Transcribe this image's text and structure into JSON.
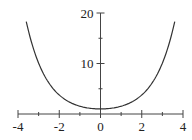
{
  "chart_data": {
    "type": "line",
    "title": "",
    "xlabel": "",
    "ylabel": "",
    "function": "y = cosh(x)",
    "xlim": [
      -4,
      4
    ],
    "ylim": [
      0,
      20
    ],
    "grid": false,
    "legend": null,
    "x_ticks_major": [
      -4,
      -2,
      0,
      2,
      4
    ],
    "x_ticks_minor": [
      -3,
      -1,
      1,
      3
    ],
    "x_tick_labels": [
      "-4",
      "-2",
      "0",
      "2",
      "4"
    ],
    "y_ticks_major": [
      10,
      20
    ],
    "y_ticks_minor": [
      5,
      15
    ],
    "y_tick_labels": [
      "10",
      "20"
    ],
    "series": [
      {
        "name": "curve",
        "color": "#333333",
        "x": [
          -3.6,
          -3.5,
          -3.25,
          -3,
          -2.75,
          -2.5,
          -2.25,
          -2,
          -1.75,
          -1.5,
          -1.25,
          -1,
          -0.75,
          -0.5,
          -0.25,
          0,
          0.25,
          0.5,
          0.75,
          1,
          1.25,
          1.5,
          1.75,
          2,
          2.25,
          2.5,
          2.75,
          3,
          3.25,
          3.5,
          3.6
        ],
        "y": [
          18.31,
          16.57,
          12.92,
          10.07,
          7.85,
          6.13,
          4.8,
          3.76,
          2.96,
          2.35,
          1.89,
          1.54,
          1.29,
          1.13,
          1.03,
          1.0,
          1.03,
          1.13,
          1.29,
          1.54,
          1.89,
          2.35,
          2.96,
          3.76,
          4.8,
          6.13,
          7.85,
          10.07,
          12.92,
          16.57,
          18.31
        ]
      }
    ]
  }
}
